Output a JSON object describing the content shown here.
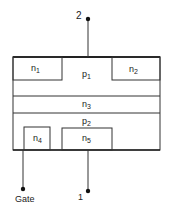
{
  "diagram": {
    "terminals": {
      "top": {
        "label": "2"
      },
      "bottom": {
        "label": "1"
      },
      "gate": {
        "label": "Gate"
      }
    },
    "regions": {
      "n1": {
        "base": "n",
        "sub": "1"
      },
      "p1": {
        "base": "p",
        "sub": "1"
      },
      "n2": {
        "base": "n",
        "sub": "2"
      },
      "n3": {
        "base": "n",
        "sub": "3"
      },
      "p2": {
        "base": "p",
        "sub": "2"
      },
      "n4": {
        "base": "n",
        "sub": "4"
      },
      "n5": {
        "base": "n",
        "sub": "5"
      }
    },
    "colors": {
      "line": "#333333",
      "background": "#ffffff"
    }
  }
}
